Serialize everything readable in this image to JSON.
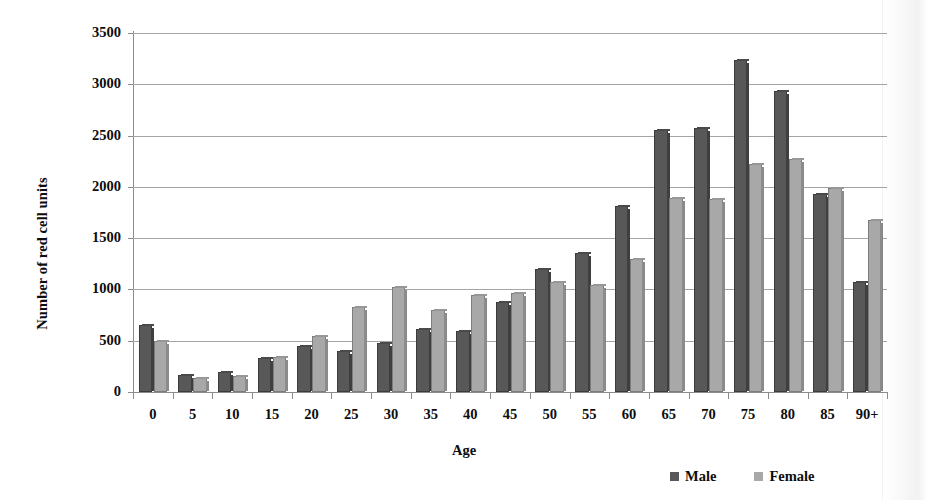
{
  "chart_data": {
    "type": "bar",
    "title": "",
    "subtitle": "",
    "xlabel": "Age",
    "ylabel": "Number of red cell units",
    "ylim": [
      0,
      3500
    ],
    "ytick_step": 500,
    "yticks": [
      3500,
      3000,
      2500,
      2000,
      1500,
      1000,
      500,
      0
    ],
    "grid": true,
    "legend_position": "bottom-right",
    "categories": [
      "0",
      "5",
      "10",
      "15",
      "20",
      "25",
      "30",
      "35",
      "40",
      "45",
      "50",
      "55",
      "60",
      "65",
      "70",
      "75",
      "80",
      "85",
      "90+"
    ],
    "series": [
      {
        "name": "Male",
        "color": "#585858",
        "values": [
          650,
          170,
          195,
          330,
          450,
          400,
          475,
          610,
          595,
          880,
          1200,
          1360,
          1810,
          2555,
          2570,
          3240,
          2930,
          1930,
          1070
        ]
      },
      {
        "name": "Female",
        "color": "#a8a8a8",
        "values": [
          495,
          135,
          155,
          340,
          550,
          825,
          1025,
          800,
          950,
          965,
          1070,
          1040,
          1300,
          1890,
          1885,
          2225,
          2270,
          1985,
          1680
        ]
      }
    ]
  },
  "legend": {
    "entries": [
      {
        "label": "Male",
        "swatch": "male-swatch"
      },
      {
        "label": "Female",
        "swatch": "female-swatch"
      }
    ]
  }
}
